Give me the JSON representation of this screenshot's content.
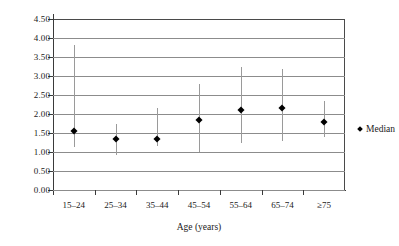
{
  "chart_data": {
    "type": "scatter",
    "title": "",
    "xlabel": "Age (years)",
    "ylabel": "",
    "categories": [
      "15–24",
      "25–34",
      "35–44",
      "45–54",
      "55–64",
      "65–74",
      "≥75"
    ],
    "values": [
      1.55,
      1.35,
      1.35,
      1.85,
      2.1,
      2.15,
      1.8
    ],
    "range_low": [
      1.13,
      0.93,
      1.15,
      1.0,
      1.25,
      1.3,
      1.4
    ],
    "range_high": [
      3.82,
      1.75,
      2.15,
      2.8,
      3.25,
      3.18,
      2.35
    ],
    "ylim": [
      0.0,
      4.5
    ],
    "ytick_labels": [
      "4.50",
      "4.00",
      "3.50",
      "3.00",
      "2.50",
      "2.00",
      "1.50",
      "1.00",
      "0.50",
      "0.00"
    ],
    "ytick_values": [
      4.5,
      4.0,
      3.5,
      3.0,
      2.5,
      2.0,
      1.5,
      1.0,
      0.5,
      0.0
    ],
    "grid": true,
    "legend": {
      "position": "right",
      "entries": [
        {
          "label": "Median",
          "marker": "diamond",
          "color": "#000000"
        }
      ]
    },
    "series": [
      {
        "name": "Median",
        "marker_color": "#000000",
        "range_color": "#9a9a9a",
        "points": [
          {
            "category": "15–24",
            "median": 1.55,
            "low": 1.13,
            "high": 3.82
          },
          {
            "category": "25–34",
            "median": 1.35,
            "low": 0.93,
            "high": 1.75
          },
          {
            "category": "35–44",
            "median": 1.35,
            "low": 1.15,
            "high": 2.15
          },
          {
            "category": "45–54",
            "median": 1.85,
            "low": 1.0,
            "high": 2.8
          },
          {
            "category": "55–64",
            "median": 2.1,
            "low": 1.25,
            "high": 3.25
          },
          {
            "category": "65–74",
            "median": 2.15,
            "low": 1.3,
            "high": 3.18
          },
          {
            "category": "≥75",
            "median": 1.8,
            "low": 1.4,
            "high": 2.35
          }
        ]
      }
    ]
  }
}
